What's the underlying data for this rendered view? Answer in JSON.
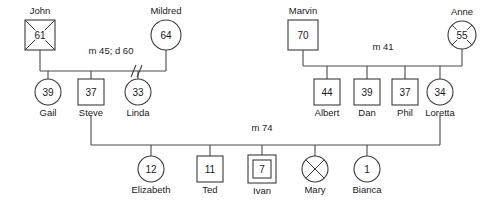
{
  "diagram": {
    "type": "genogram",
    "colors": {
      "background": "#ffffff",
      "stroke": "#3b3b3b",
      "link": "#4a4a4a",
      "text": "#1a1a1a"
    }
  },
  "people": [
    {
      "id": "john",
      "name": "John",
      "age": "61",
      "gender": "male",
      "shape": "square",
      "deceased": true,
      "identified_patient": false,
      "name_position": "above",
      "cx": 40,
      "cy": 35,
      "size": 30
    },
    {
      "id": "mildred",
      "name": "Mildred",
      "age": "64",
      "gender": "female",
      "shape": "circle",
      "deceased": false,
      "identified_patient": false,
      "name_position": "above",
      "cx": 166,
      "cy": 35,
      "size": 30
    },
    {
      "id": "marvin",
      "name": "Marvin",
      "age": "70",
      "gender": "male",
      "shape": "square",
      "deceased": false,
      "identified_patient": false,
      "name_position": "above",
      "cx": 303,
      "cy": 35,
      "size": 30
    },
    {
      "id": "anne",
      "name": "Anne",
      "age": "55",
      "gender": "female",
      "shape": "circle",
      "deceased": true,
      "identified_patient": false,
      "name_position": "above",
      "cx": 462,
      "cy": 35,
      "size": 28
    },
    {
      "id": "gail",
      "name": "Gail",
      "age": "39",
      "gender": "female",
      "shape": "circle",
      "deceased": false,
      "identified_patient": false,
      "name_position": "below",
      "cx": 48,
      "cy": 92,
      "size": 26
    },
    {
      "id": "steve",
      "name": "Steve",
      "age": "37",
      "gender": "male",
      "shape": "square",
      "deceased": false,
      "identified_patient": false,
      "name_position": "below",
      "cx": 91,
      "cy": 92,
      "size": 26
    },
    {
      "id": "linda",
      "name": "Linda",
      "age": "33",
      "gender": "female",
      "shape": "circle",
      "deceased": false,
      "identified_patient": false,
      "name_position": "below",
      "cx": 138,
      "cy": 92,
      "size": 26
    },
    {
      "id": "albert",
      "name": "Albert",
      "age": "44",
      "gender": "male",
      "shape": "square",
      "deceased": false,
      "identified_patient": false,
      "name_position": "below",
      "cx": 327,
      "cy": 92,
      "size": 26
    },
    {
      "id": "dan",
      "name": "Dan",
      "age": "39",
      "gender": "male",
      "shape": "square",
      "deceased": false,
      "identified_patient": false,
      "name_position": "below",
      "cx": 367,
      "cy": 92,
      "size": 26
    },
    {
      "id": "phil",
      "name": "Phil",
      "age": "37",
      "gender": "male",
      "shape": "square",
      "deceased": false,
      "identified_patient": false,
      "name_position": "below",
      "cx": 405,
      "cy": 92,
      "size": 26
    },
    {
      "id": "loretta",
      "name": "Loretta",
      "age": "34",
      "gender": "female",
      "shape": "circle",
      "deceased": false,
      "identified_patient": false,
      "name_position": "below",
      "cx": 440,
      "cy": 92,
      "size": 26
    },
    {
      "id": "elizabeth",
      "name": "Elizabeth",
      "age": "12",
      "gender": "female",
      "shape": "circle",
      "deceased": false,
      "identified_patient": false,
      "name_position": "below",
      "cx": 151,
      "cy": 169,
      "size": 26
    },
    {
      "id": "ted",
      "name": "Ted",
      "age": "11",
      "gender": "male",
      "shape": "square",
      "deceased": false,
      "identified_patient": false,
      "name_position": "below",
      "cx": 210,
      "cy": 169,
      "size": 26
    },
    {
      "id": "ivan",
      "name": "Ivan",
      "age": "7",
      "gender": "male",
      "shape": "square",
      "deceased": false,
      "identified_patient": true,
      "name_position": "below",
      "cx": 262,
      "cy": 169,
      "size": 28
    },
    {
      "id": "mary",
      "name": "Mary",
      "age": "",
      "gender": "female",
      "shape": "circle",
      "deceased": true,
      "identified_patient": false,
      "name_position": "below",
      "cx": 315,
      "cy": 169,
      "size": 26
    },
    {
      "id": "bianca",
      "name": "Bianca",
      "age": "1",
      "gender": "female",
      "shape": "circle",
      "deceased": false,
      "identified_patient": false,
      "name_position": "below",
      "cx": 367,
      "cy": 169,
      "size": 26
    }
  ],
  "relationships": [
    {
      "id": "john-mildred",
      "label": "m 45; d 60",
      "label_x": 111,
      "label_y": 54,
      "status": "divorced",
      "partner_left": "john",
      "partner_right": "mildred",
      "bar_y": 71,
      "left_x": 40,
      "right_x": 166,
      "left_drop_from": 50,
      "right_drop_from": 50,
      "divorce_x": 133,
      "children": [
        "gail",
        "steve",
        "linda"
      ]
    },
    {
      "id": "marvin-anne",
      "label": "m 41",
      "label_x": 383,
      "label_y": 50,
      "status": "married",
      "partner_left": "marvin",
      "partner_right": "anne",
      "bar_y": 66,
      "left_x": 303,
      "right_x": 462,
      "left_drop_from": 50,
      "right_drop_from": 49,
      "children": [
        "albert",
        "dan",
        "phil",
        "loretta"
      ]
    },
    {
      "id": "steve-loretta",
      "label": "m 74",
      "label_x": 262,
      "label_y": 131,
      "status": "married",
      "partner_left": "steve",
      "partner_right": "loretta",
      "bar_y": 145,
      "left_x": 91,
      "right_x": 440,
      "left_drop_from": 115,
      "right_drop_from": 115,
      "children": [
        "elizabeth",
        "ted",
        "ivan",
        "mary",
        "bianca"
      ]
    }
  ]
}
